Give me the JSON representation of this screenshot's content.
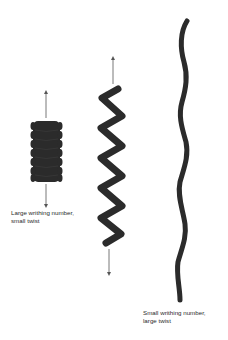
{
  "figure": {
    "colors": {
      "strand": "#2b2b2b",
      "arrow": "#555555",
      "text": "#2a2a2a",
      "background": "#ffffff"
    },
    "structures": [
      {
        "id": "left",
        "shape": "tightly coiled solenoid",
        "caption_line1": "Large writhing number,",
        "caption_line2": "small twist"
      },
      {
        "id": "middle",
        "shape": "zigzag helix",
        "caption_line1": "",
        "caption_line2": ""
      },
      {
        "id": "right",
        "shape": "extended wavy strand",
        "caption_line1": "Small writhing number,",
        "caption_line2": "large twist"
      }
    ]
  }
}
